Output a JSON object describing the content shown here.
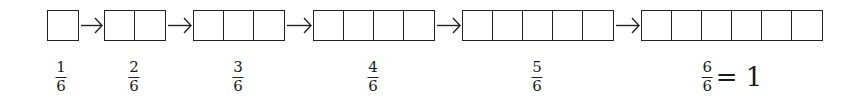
{
  "diagram": {
    "title": "",
    "denominator": 6,
    "steps": [
      {
        "cells": 1,
        "left": 47,
        "label_center": 61,
        "numerator": "1",
        "denominator": "6",
        "suffix": ""
      },
      {
        "cells": 2,
        "left": 104,
        "label_center": 134,
        "numerator": "2",
        "denominator": "6",
        "suffix": ""
      },
      {
        "cells": 3,
        "left": 193,
        "label_center": 238,
        "numerator": "3",
        "denominator": "6",
        "suffix": ""
      },
      {
        "cells": 4,
        "left": 313,
        "label_center": 373,
        "numerator": "4",
        "denominator": "6",
        "suffix": ""
      },
      {
        "cells": 5,
        "left": 462,
        "label_center": 537,
        "numerator": "5",
        "denominator": "6",
        "suffix": ""
      },
      {
        "cells": 6,
        "left": 641,
        "label_center": 715,
        "numerator": "6",
        "denominator": "6",
        "suffix": "= 1"
      }
    ],
    "arrow_glyph": "→",
    "colors": {
      "line": "#222222",
      "background": "#ffffff"
    }
  }
}
